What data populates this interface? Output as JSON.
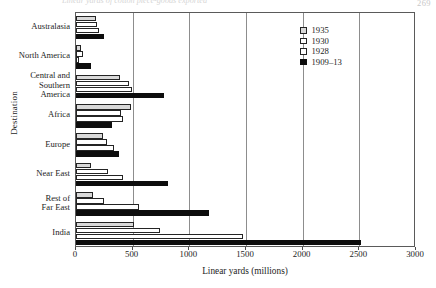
{
  "page": {
    "number": "269",
    "caption": "Linear yards of cotton piece-goods exported"
  },
  "chart_data": {
    "type": "bar",
    "orientation": "horizontal",
    "title": "",
    "xlabel": "Linear yards (millions)",
    "ylabel": "Destination",
    "xlim": [
      0,
      3000
    ],
    "xticks": [
      0,
      500,
      1000,
      1500,
      2000,
      2500,
      3000
    ],
    "xtick_labels": [
      "0",
      "500",
      "1000",
      "1500",
      "2000",
      "2500",
      "3000"
    ],
    "grid": true,
    "grid_axis": "x",
    "legend_position": "upper right",
    "categories": [
      "Australasia",
      "North America",
      "Central and\nSouthern\nAmerica",
      "Africa",
      "Europe",
      "Near East",
      "Rest of\nFar East",
      "India"
    ],
    "series": [
      {
        "name": "1935",
        "color": "#d9d9d9",
        "values": [
          180,
          45,
          390,
          485,
          240,
          130,
          150,
          515
        ]
      },
      {
        "name": "1930",
        "color": "#ffffff",
        "values": [
          185,
          60,
          465,
          395,
          275,
          280,
          245,
          740
        ]
      },
      {
        "name": "1928",
        "color": "#ffffff",
        "values": [
          200,
          30,
          490,
          415,
          335,
          415,
          555,
          1475
        ]
      },
      {
        "name": "1909–13",
        "color": "#0d0d0d",
        "values": [
          250,
          130,
          780,
          320,
          380,
          810,
          1170,
          2515
        ]
      }
    ]
  },
  "legend": {
    "entries": [
      {
        "label": "1935",
        "swatch": "s1935"
      },
      {
        "label": "1930",
        "swatch": "s1930"
      },
      {
        "label": "1928",
        "swatch": "s1928"
      },
      {
        "label": "1909–13",
        "swatch": "s1909"
      }
    ]
  }
}
